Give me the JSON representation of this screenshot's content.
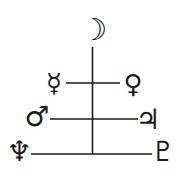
{
  "diagram": {
    "line_color": "#1a1a1a",
    "apex": {
      "name": "Moon",
      "symbol": "☽"
    },
    "rows": [
      {
        "left": {
          "name": "Mercury",
          "symbol": "☿"
        },
        "right": {
          "name": "Venus",
          "symbol": "♀"
        }
      },
      {
        "left": {
          "name": "Mars",
          "symbol": "♂"
        },
        "right": {
          "name": "Jupiter",
          "symbol": "♃"
        }
      },
      {
        "left": {
          "name": "Neptune",
          "symbol": "♆"
        },
        "right": {
          "name": "Pluto",
          "symbol": "♇"
        }
      }
    ]
  }
}
